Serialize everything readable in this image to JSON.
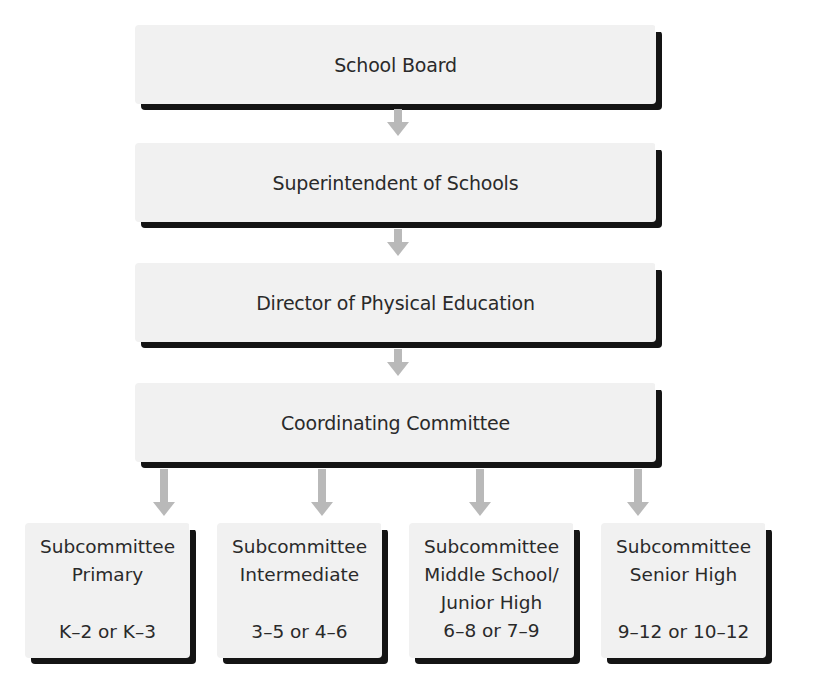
{
  "diagram": {
    "type": "org-chart",
    "levels": [
      {
        "id": "school-board",
        "label": "School Board"
      },
      {
        "id": "superintendent",
        "label": "Superintendent of Schools"
      },
      {
        "id": "director-pe",
        "label": "Director of Physical Education"
      },
      {
        "id": "coordinating-committee",
        "label": "Coordinating Committee"
      }
    ],
    "subcommittees": [
      {
        "id": "primary",
        "lines": [
          "Subcommittee",
          "Primary"
        ],
        "grades": "K–2 or K–3"
      },
      {
        "id": "intermediate",
        "lines": [
          "Subcommittee",
          "Intermediate"
        ],
        "grades": "3–5 or 4–6"
      },
      {
        "id": "middle-school",
        "lines": [
          "Subcommittee",
          "Middle School/",
          "Junior High"
        ],
        "grades": "6–8 or 7–9"
      },
      {
        "id": "senior-high",
        "lines": [
          "Subcommittee",
          "Senior High"
        ],
        "grades": "9–12 or 10–12"
      }
    ],
    "edges": [
      [
        "school-board",
        "superintendent"
      ],
      [
        "superintendent",
        "director-pe"
      ],
      [
        "director-pe",
        "coordinating-committee"
      ],
      [
        "coordinating-committee",
        "primary"
      ],
      [
        "coordinating-committee",
        "intermediate"
      ],
      [
        "coordinating-committee",
        "middle-school"
      ],
      [
        "coordinating-committee",
        "senior-high"
      ]
    ],
    "colors": {
      "box_fill": "#f1f1f1",
      "box_shadow": "#141414",
      "arrow": "#b9b9b9",
      "text": "#2a2a2a"
    }
  }
}
